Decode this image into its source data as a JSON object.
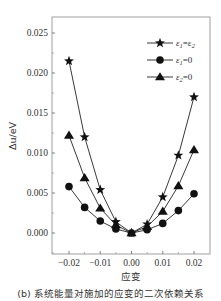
{
  "chart_data": {
    "type": "line",
    "title": "",
    "xlabel": "应变",
    "ylabel": "Δu/eV",
    "xlim": [
      -0.025,
      0.025
    ],
    "ylim": [
      -0.002,
      0.027
    ],
    "grid": false,
    "legend_position": "upper right",
    "x": [
      -0.02,
      -0.015,
      -0.01,
      -0.005,
      0.0,
      0.005,
      0.01,
      0.015,
      0.02
    ],
    "x_ticks": [
      "-0.02",
      "-0.01",
      "0.00",
      "0.01",
      "0.02"
    ],
    "x_tick_values": [
      -0.02,
      -0.01,
      0.0,
      0.01,
      0.02
    ],
    "y_ticks": [
      "0.000",
      "0.005",
      "0.010",
      "0.015",
      "0.020",
      "0.025"
    ],
    "y_tick_values": [
      0.0,
      0.005,
      0.01,
      0.015,
      0.02,
      0.025
    ],
    "series": [
      {
        "name": "ε1=ε2",
        "marker": "star",
        "values": [
          0.0215,
          0.012,
          0.0054,
          0.0014,
          0.0,
          0.0011,
          0.0045,
          0.0097,
          0.017
        ]
      },
      {
        "name": "ε1=0",
        "marker": "circle",
        "values": [
          0.0058,
          0.0032,
          0.0015,
          0.0005,
          0.0,
          0.0004,
          0.0012,
          0.0028,
          0.0049
        ]
      },
      {
        "name": "ε2=0",
        "marker": "triangle",
        "values": [
          0.0122,
          0.0069,
          0.0031,
          0.001,
          0.0,
          0.0008,
          0.0027,
          0.0059,
          0.0104
        ]
      }
    ]
  },
  "legend": [
    {
      "base": "ε",
      "sub1": "1",
      "mid": "=ε",
      "sub2": "2"
    },
    {
      "base": "ε",
      "sub1": "1",
      "mid": "=0",
      "sub2": ""
    },
    {
      "base": "ε",
      "sub1": "2",
      "mid": "=0",
      "sub2": ""
    }
  ],
  "caption": "(b) 系统能量对施加的应变的二次依赖关系"
}
